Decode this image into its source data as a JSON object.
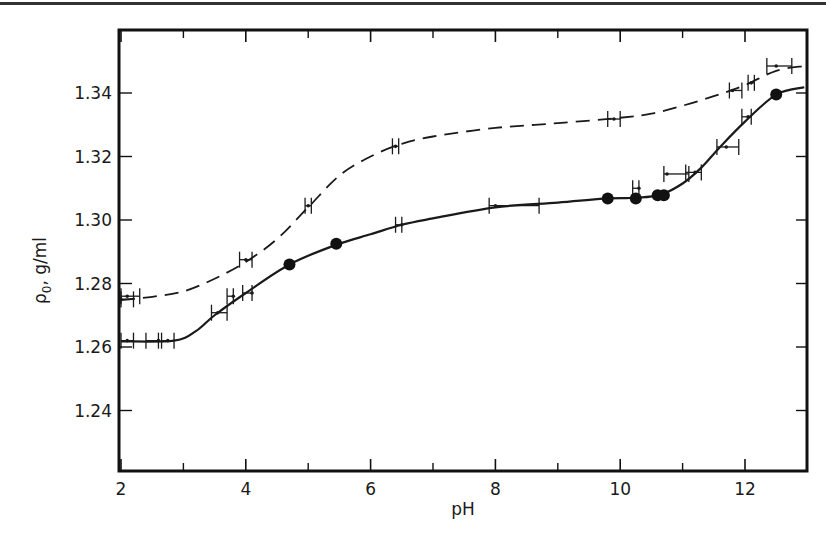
{
  "chart_data": {
    "type": "line",
    "title": "",
    "xlabel": "pH",
    "ylabel": "ρ0, g/ml",
    "ylabel_main": "ρ",
    "ylabel_sub": "0",
    "ylabel_unit": ", g/ml",
    "xlim": [
      2,
      13
    ],
    "ylim": [
      1.221,
      1.36
    ],
    "x_ticks_major": [
      2,
      4,
      6,
      8,
      10,
      12
    ],
    "x_tick_labels": [
      "2",
      "4",
      "6",
      "8",
      "10",
      "12"
    ],
    "x_ticks_minor": [
      3,
      5,
      7,
      9,
      11
    ],
    "y_ticks": [
      1.24,
      1.26,
      1.28,
      1.3,
      1.32,
      1.34
    ],
    "y_tick_labels": [
      "1.24",
      "1.26",
      "1.28",
      "1.30",
      "1.32",
      "1.34"
    ],
    "grid": false,
    "legend": null,
    "series": [
      {
        "name": "dashed curve",
        "style": "dashed",
        "curve": [
          [
            2.0,
            1.2748
          ],
          [
            2.5,
            1.2758
          ],
          [
            3.0,
            1.2775
          ],
          [
            3.5,
            1.2815
          ],
          [
            4.0,
            1.2868
          ],
          [
            4.5,
            1.294
          ],
          [
            5.0,
            1.304
          ],
          [
            5.5,
            1.314
          ],
          [
            6.0,
            1.32
          ],
          [
            6.5,
            1.324
          ],
          [
            7.0,
            1.3263
          ],
          [
            8.0,
            1.329
          ],
          [
            9.0,
            1.3305
          ],
          [
            10.0,
            1.3322
          ],
          [
            10.5,
            1.3335
          ],
          [
            11.0,
            1.336
          ],
          [
            11.5,
            1.339
          ],
          [
            12.0,
            1.3425
          ],
          [
            12.5,
            1.347
          ],
          [
            12.95,
            1.3485
          ]
        ],
        "points": [
          {
            "x": 2.1,
            "y": 1.276,
            "xerr": [
              2.0,
              2.3
            ]
          },
          {
            "x": 2.0,
            "y": 1.275,
            "xerr": [
              2.0,
              2.2
            ]
          },
          {
            "x": 4.0,
            "y": 1.2875,
            "xerr": [
              3.9,
              4.1
            ]
          },
          {
            "x": 5.0,
            "y": 1.3045,
            "xerr": [
              4.95,
              5.05
            ]
          },
          {
            "x": 6.4,
            "y": 1.3232,
            "xerr": [
              6.35,
              6.45
            ]
          },
          {
            "x": 9.9,
            "y": 1.3318,
            "xerr": [
              9.8,
              10.0
            ]
          },
          {
            "x": 11.8,
            "y": 1.3408,
            "xerr": [
              11.75,
              11.95
            ]
          },
          {
            "x": 12.1,
            "y": 1.3432,
            "xerr": [
              12.05,
              12.15
            ]
          },
          {
            "x": 12.5,
            "y": 1.3485,
            "xerr": [
              12.35,
              12.75
            ]
          }
        ]
      },
      {
        "name": "solid curve",
        "style": "solid",
        "curve": [
          [
            2.0,
            1.2618
          ],
          [
            2.85,
            1.262
          ],
          [
            3.2,
            1.265
          ],
          [
            3.5,
            1.27
          ],
          [
            4.0,
            1.277
          ],
          [
            4.7,
            1.286
          ],
          [
            5.45,
            1.2922
          ],
          [
            6.0,
            1.2955
          ],
          [
            6.5,
            1.2985
          ],
          [
            7.0,
            1.3005
          ],
          [
            8.0,
            1.304
          ],
          [
            9.0,
            1.3055
          ],
          [
            9.8,
            1.3068
          ],
          [
            10.25,
            1.307
          ],
          [
            10.65,
            1.308
          ],
          [
            11.0,
            1.3115
          ],
          [
            11.3,
            1.3165
          ],
          [
            11.6,
            1.323
          ],
          [
            12.0,
            1.331
          ],
          [
            12.5,
            1.3395
          ],
          [
            12.95,
            1.3418
          ]
        ],
        "filled_points": [
          {
            "x": 4.7,
            "y": 1.286
          },
          {
            "x": 5.45,
            "y": 1.2925
          },
          {
            "x": 9.8,
            "y": 1.3068
          },
          {
            "x": 10.25,
            "y": 1.3068
          },
          {
            "x": 10.6,
            "y": 1.3078
          },
          {
            "x": 10.7,
            "y": 1.3078
          },
          {
            "x": 12.5,
            "y": 1.3395
          }
        ],
        "points": [
          {
            "x": 2.1,
            "y": 1.262,
            "xerr": [
              2.0,
              2.2
            ]
          },
          {
            "x": 2.6,
            "y": 1.262,
            "xerr": [
              2.4,
              2.6
            ]
          },
          {
            "x": 2.75,
            "y": 1.262,
            "xerr": [
              2.65,
              2.85
            ]
          },
          {
            "x": 3.55,
            "y": 1.2708,
            "xerr": [
              3.45,
              3.7
            ]
          },
          {
            "x": 3.8,
            "y": 1.276,
            "xerr": [
              3.7,
              3.8
            ]
          },
          {
            "x": 4.1,
            "y": 1.277,
            "xerr": [
              3.95,
              4.1
            ]
          },
          {
            "x": 6.5,
            "y": 1.2985,
            "xerr": [
              6.4,
              6.5
            ]
          },
          {
            "x": 8.0,
            "y": 1.3045,
            "xerr": [
              7.9,
              8.7
            ]
          },
          {
            "x": 10.3,
            "y": 1.31,
            "xerr": [
              10.2,
              10.3
            ]
          },
          {
            "x": 10.75,
            "y": 1.3145,
            "xerr": [
              10.7,
              11.1
            ]
          },
          {
            "x": 11.2,
            "y": 1.315,
            "xerr": [
              11.05,
              11.3
            ]
          },
          {
            "x": 11.7,
            "y": 1.323,
            "xerr": [
              11.55,
              11.9
            ]
          },
          {
            "x": 12.05,
            "y": 1.3325,
            "xerr": [
              11.95,
              12.1
            ]
          }
        ]
      }
    ]
  },
  "layout": {
    "plot": {
      "left": 119,
      "top": 30,
      "right": 807,
      "bottom": 471
    },
    "x_scale": {
      "x0": 2,
      "px0": 121,
      "px_per_unit": 62.4
    },
    "y_scale": {
      "y0": 1.34,
      "px0": 93,
      "px_per_unit": 3175
    }
  }
}
